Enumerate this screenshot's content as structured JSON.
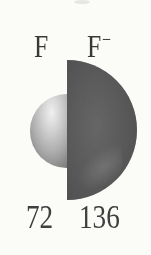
{
  "figure": {
    "caption": "Comparison of atomic and ionic size",
    "atom": {
      "symbol": "F",
      "radius_value": "72"
    },
    "ion": {
      "symbol": "F",
      "charge": "−",
      "radius_value": "136"
    },
    "colors": {
      "background": "#fbfbf8",
      "text": "#383838",
      "atom_sphere_highlight": "#f6f6f6",
      "atom_sphere_mid": "#a8a8a8",
      "atom_sphere_edge": "#565656",
      "ion_sphere_core": "#424242",
      "ion_sphere_body": "#2d2d2d",
      "ion_sphere_edge": "#1c1c1c",
      "ion_sheen": "#6a6a6a"
    }
  }
}
